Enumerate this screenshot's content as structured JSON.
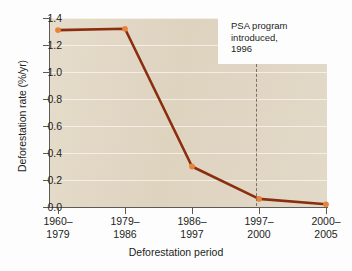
{
  "chart_data": {
    "type": "line",
    "title": "",
    "xlabel": "Deforestation period",
    "ylabel": "Deforestation rate (%/yr)",
    "categories": [
      "1960–1979",
      "1979–1986",
      "1986–1997",
      "1997–2000",
      "2000–2005"
    ],
    "category_lines": [
      [
        "1960–",
        "1979"
      ],
      [
        "1979–",
        "1986"
      ],
      [
        "1986–",
        "1997"
      ],
      [
        "1997–",
        "2000"
      ],
      [
        "2000–",
        "2005"
      ]
    ],
    "values": [
      1.31,
      1.32,
      0.3,
      0.06,
      0.02
    ],
    "ylim": [
      0.0,
      1.4
    ],
    "yticks": [
      "0.0",
      "0.2",
      "0.4",
      "0.6",
      "0.8",
      "1.0",
      "1.2",
      "1.4"
    ],
    "ytick_values": [
      0.0,
      0.2,
      0.4,
      0.6,
      0.8,
      1.0,
      1.2,
      1.4
    ],
    "grid": true,
    "legend": "none",
    "annotations": [
      {
        "lines": [
          "PSA program",
          "introduced,",
          "1996"
        ],
        "marker": "vertical-dashed-line",
        "at_x": 1996
      }
    ],
    "colors": {
      "line": "#8b2e10",
      "marker": "#e8833a",
      "plot_background": "#e1d6c3",
      "gridline": "#fffdf7",
      "axis": "#5d5b58",
      "annotation_line": "#77726c",
      "figure_background": "#fdfdfd"
    }
  }
}
